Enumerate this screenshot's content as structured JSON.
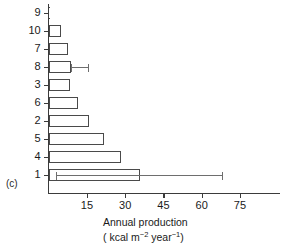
{
  "figure": {
    "panel_label": "(c)",
    "axis_title_line1": "Annual production",
    "axis_title_line2_prefix": "( kcal m",
    "axis_title_sup1": "−2",
    "axis_title_mid": " year",
    "axis_title_sup2": "−1",
    "axis_title_suffix": ")"
  },
  "chart_data": {
    "type": "bar",
    "orientation": "horizontal",
    "title": "",
    "xlabel": "Annual production (kcal m−2 year−1)",
    "ylabel": "",
    "xlim": [
      0,
      82
    ],
    "ylim": [
      0,
      10
    ],
    "grid": false,
    "legend": null,
    "xticks": [
      15,
      30,
      45,
      60,
      75
    ],
    "xtick_labels": [
      "15",
      "30",
      "45",
      "60",
      "75"
    ],
    "categories": [
      "9",
      "10",
      "7",
      "8",
      "3",
      "6",
      "2",
      "5",
      "4",
      "1"
    ],
    "values": [
      0.3,
      4.7,
      7.5,
      8.7,
      8.5,
      11.5,
      16.0,
      21.5,
      28.5,
      36.0
    ],
    "error_bars": [
      {
        "category": "8",
        "low": 8.7,
        "high": 15.5
      },
      {
        "category": "1",
        "low": 3.0,
        "high": 68.0
      }
    ]
  }
}
